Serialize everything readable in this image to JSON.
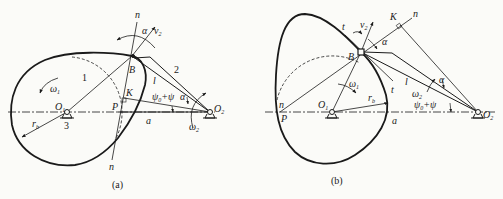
{
  "figures": [
    {
      "id": "a",
      "caption": "(a)",
      "labels": {
        "n_top": "n",
        "alpha": "α",
        "v2": "v",
        "v2_sub": "2",
        "omega1": "ω",
        "omega1_sub": "1",
        "link1": "1",
        "link2": "2",
        "B": "B",
        "l": "l",
        "K": "K",
        "psi": "ψ",
        "psi_sub": "0",
        "psi_rest": "+ψ",
        "alpha2": "α",
        "O1": "O",
        "O1_sub": "1",
        "O2": "O",
        "O2_sub": "2",
        "P": "P",
        "a": "a",
        "rb": "r",
        "rb_sub": "b",
        "frame3": "3",
        "omega2": "ω",
        "omega2_sub": "2",
        "n_bottom": "n"
      }
    },
    {
      "id": "b",
      "caption": "(b)",
      "labels": {
        "t_top": "t",
        "v2": "v",
        "v2_sub": "2",
        "K": "K",
        "n_top": "n",
        "alpha": "α",
        "B": "B",
        "t_bottom": "t",
        "omega1": "ω",
        "omega1_sub": "1",
        "l": "l",
        "alpha2": "α",
        "omega2": "ω",
        "omega2_sub": "2",
        "rb": "r",
        "rb_sub": "b",
        "n_left": "n",
        "P": "P",
        "O1": "O",
        "O1_sub": "1",
        "psi": "ψ",
        "psi_sub": "0",
        "psi_rest": "+ψ",
        "a": "a",
        "O2": "O",
        "O2_sub": "2"
      }
    }
  ],
  "colors": {
    "ink": "#1a1a1a",
    "background": "#fbfbf8"
  }
}
